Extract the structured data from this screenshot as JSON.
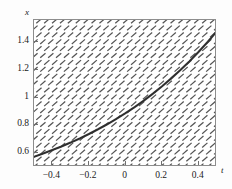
{
  "chart_data": {
    "type": "line",
    "title": "",
    "subtitle": "",
    "xlabel": "t",
    "ylabel": "x",
    "xlim": [
      -0.5,
      0.5
    ],
    "ylim": [
      0.5,
      1.56
    ],
    "grid": false,
    "legend": null,
    "annotations": [],
    "xticks": [
      {
        "value": -0.4,
        "label": "−0.4"
      },
      {
        "value": -0.2,
        "label": "−0.2"
      },
      {
        "value": 0,
        "label": "0"
      },
      {
        "value": 0.2,
        "label": "0.2"
      },
      {
        "value": 0.4,
        "label": "0.4"
      }
    ],
    "yticks": [
      {
        "value": 1.4,
        "label": "1.4"
      },
      {
        "value": 1.2,
        "label": "1.2"
      },
      {
        "value": 1.0,
        "label": "1"
      },
      {
        "value": 0.8,
        "label": "0.8"
      },
      {
        "value": 0.6,
        "label": "0.6"
      }
    ],
    "series": [
      {
        "name": "solution curve",
        "type": "line",
        "color": "#3a3a3a",
        "x": [
          -0.5,
          -0.45,
          -0.4,
          -0.35,
          -0.3,
          -0.25,
          -0.2,
          -0.15,
          -0.1,
          -0.05,
          0.0,
          0.05,
          0.1,
          0.15,
          0.2,
          0.25,
          0.3,
          0.35,
          0.4,
          0.45,
          0.5
        ],
        "y": [
          0.573,
          0.597,
          0.622,
          0.648,
          0.676,
          0.706,
          0.738,
          0.772,
          0.808,
          0.847,
          0.888,
          0.932,
          0.979,
          1.029,
          1.082,
          1.139,
          1.199,
          1.263,
          1.331,
          1.403,
          1.48
        ]
      }
    ],
    "vector_field": {
      "name": "direction field",
      "type": "slope-field",
      "color": "#545454",
      "slope_expression": "dx/dt = x",
      "angle_degrees": 41,
      "dash_length": 7,
      "spacing_x": 7.9,
      "spacing_y": 6.9,
      "columns": 24,
      "rows": 22
    },
    "frame": {
      "color": "#8d8d8d",
      "background": "#ffffff"
    }
  }
}
